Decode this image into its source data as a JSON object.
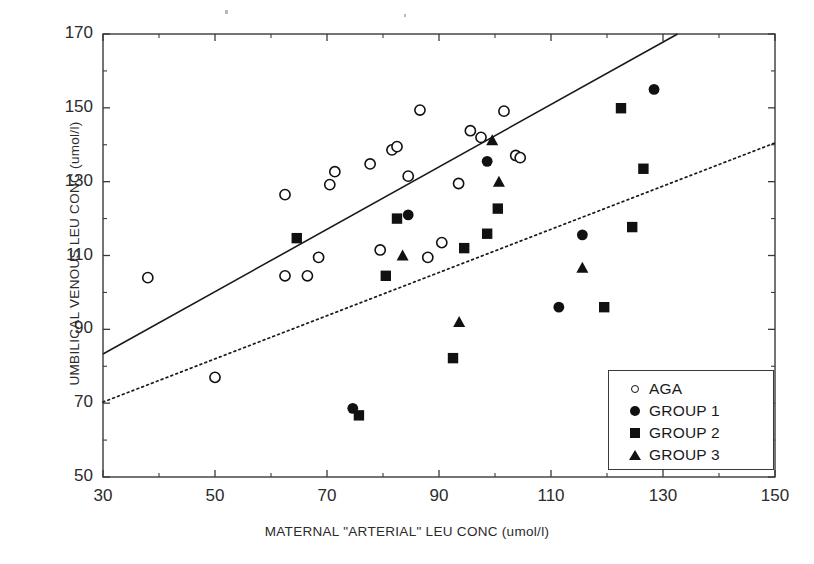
{
  "chart_data": {
    "type": "scatter",
    "title": "",
    "xlabel": "MATERNAL \"ARTERIAL\" LEU CONC (umol/l)",
    "ylabel": "UMBILICAL VENOUS LEU CONC (umol/l)",
    "xlim": [
      30,
      150
    ],
    "ylim": [
      50,
      170
    ],
    "xticks": [
      30,
      50,
      70,
      90,
      110,
      130,
      150
    ],
    "yticks": [
      50,
      70,
      90,
      110,
      130,
      150,
      170
    ],
    "xtick_labels": [
      "30",
      "50",
      "70",
      "90",
      "110",
      "130",
      "150"
    ],
    "ytick_labels": [
      "50",
      "70",
      "90",
      "110",
      "130",
      "150",
      "170"
    ],
    "minor_ticks": true,
    "grid": false,
    "legend_position": "bottom-right",
    "series": [
      {
        "name": "AGA",
        "marker": "open-circle",
        "color": "#111111",
        "points": [
          [
            38,
            104
          ],
          [
            50,
            77
          ],
          [
            62.5,
            126.5
          ],
          [
            62.5,
            104.5
          ],
          [
            66.5,
            104.5
          ],
          [
            68.5,
            109.5
          ],
          [
            70.5,
            129.2
          ],
          [
            71.4,
            132.7
          ],
          [
            77.7,
            134.8
          ],
          [
            81.6,
            138.6
          ],
          [
            82.5,
            139.5
          ],
          [
            79.5,
            111.5
          ],
          [
            84.5,
            131.5
          ],
          [
            86.6,
            149.4
          ],
          [
            88,
            109.5
          ],
          [
            93.5,
            129.5
          ],
          [
            95.6,
            143.8
          ],
          [
            97.5,
            142.0
          ],
          [
            101.6,
            149.1
          ],
          [
            103.7,
            137.1
          ],
          [
            104.5,
            136.5
          ],
          [
            90.5,
            113.5
          ]
        ]
      },
      {
        "name": "GROUP 1",
        "marker": "filled-circle",
        "color": "#111111",
        "points": [
          [
            74.6,
            68.6
          ],
          [
            84.5,
            121.0
          ],
          [
            98.6,
            135.5
          ],
          [
            111.4,
            96.0
          ],
          [
            115.6,
            115.6
          ],
          [
            128.4,
            155.0
          ]
        ]
      },
      {
        "name": "GROUP 2",
        "marker": "filled-square",
        "color": "#111111",
        "points": [
          [
            64.6,
            114.7
          ],
          [
            75.7,
            66.7
          ],
          [
            80.5,
            104.5
          ],
          [
            82.5,
            120.0
          ],
          [
            92.5,
            82.2
          ],
          [
            94.5,
            112.0
          ],
          [
            98.6,
            115.9
          ],
          [
            100.5,
            122.7
          ],
          [
            119.5,
            96.0
          ],
          [
            122.5,
            149.9
          ],
          [
            124.5,
            117.7
          ],
          [
            126.5,
            133.5
          ]
        ]
      },
      {
        "name": "GROUP 3",
        "marker": "filled-triangle",
        "color": "#111111",
        "points": [
          [
            83.5,
            110.0
          ],
          [
            93.6,
            92.0
          ],
          [
            99.5,
            141.2
          ],
          [
            100.7,
            130.0
          ],
          [
            115.6,
            106.7
          ]
        ]
      }
    ],
    "lines": [
      {
        "name": "solid-regression-line",
        "style": "solid",
        "x": [
          30,
          132.6
        ],
        "y": [
          83.3,
          170.0
        ]
      },
      {
        "name": "dotted-regression-line",
        "style": "dotted",
        "x": [
          30,
          150
        ],
        "y": [
          70.3,
          140.5
        ]
      }
    ]
  },
  "legend": {
    "items": [
      {
        "label": "AGA",
        "marker": "open-circle"
      },
      {
        "label": "GROUP 1",
        "marker": "filled-circle"
      },
      {
        "label": "GROUP 2",
        "marker": "filled-square"
      },
      {
        "label": "GROUP 3",
        "marker": "filled-triangle"
      }
    ]
  },
  "colors": {
    "axis": "#3a3a3a",
    "marker": "#111111",
    "background": "#ffffff"
  }
}
